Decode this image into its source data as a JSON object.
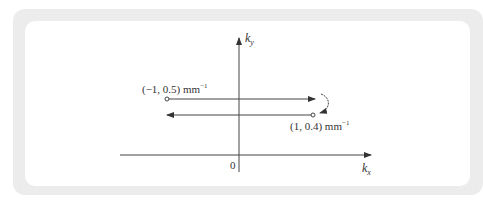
{
  "diagram": {
    "axes": {
      "x_label": "k",
      "x_sub": "x",
      "y_label": "k",
      "y_sub": "y",
      "origin_label": "0"
    },
    "points": [
      {
        "label": "(−1, 0.5) mm",
        "exp": "−1",
        "marker": "open-circle"
      },
      {
        "label": "(1, 0.4) mm",
        "exp": "−1",
        "marker": "open-circle"
      }
    ],
    "arrows": [
      {
        "from": "(-1, 0.5)",
        "to": "right",
        "direction": "rightward"
      },
      {
        "from": "right",
        "to": "(1, 0.4)",
        "direction": "curved-down"
      },
      {
        "from": "(1, 0.4)",
        "to": "left",
        "direction": "leftward"
      }
    ],
    "colors": {
      "frame": "#ececec",
      "line": "#444444",
      "text": "#333333"
    }
  }
}
